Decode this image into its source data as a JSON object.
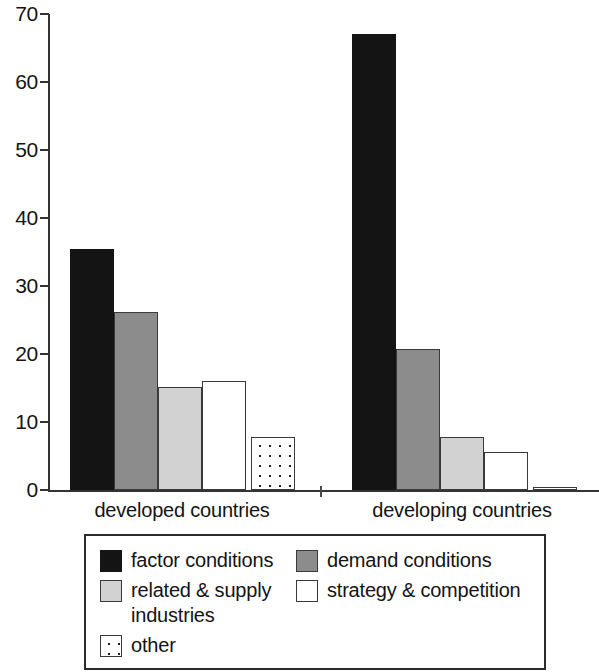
{
  "chart_data": {
    "type": "bar",
    "title": "",
    "subtitle": "",
    "xlabel": "",
    "ylabel": "",
    "categories": [
      "developed countries",
      "developing countries"
    ],
    "series": [
      {
        "name": "factor conditions",
        "key": "factor",
        "fill": "black",
        "values": [
          35.5,
          67.0
        ]
      },
      {
        "name": "demand conditions",
        "key": "demand",
        "fill": "darkgray",
        "values": [
          26.2,
          20.7
        ]
      },
      {
        "name": "related & supply industries",
        "key": "related",
        "fill": "lightgray",
        "values": [
          15.2,
          7.8
        ]
      },
      {
        "name": "strategy & competition",
        "key": "strategy",
        "fill": "white",
        "values": [
          16.0,
          5.6
        ]
      },
      {
        "name": "other",
        "key": "other",
        "fill": "dotted",
        "values": [
          7.8,
          0.4
        ]
      }
    ],
    "ylim": [
      0,
      70
    ],
    "yticks": [
      0,
      10,
      20,
      30,
      40,
      50,
      60,
      70
    ],
    "ytick_labels": [
      "0",
      "10",
      "20",
      "30",
      "40",
      "50",
      "60",
      "70"
    ],
    "grid": false,
    "legend_position": "bottom",
    "legend_entries": [
      {
        "label": "factor conditions",
        "swatch": "black"
      },
      {
        "label": "demand conditions",
        "swatch": "darkgray"
      },
      {
        "label": "related & supply industries",
        "swatch": "lightgray"
      },
      {
        "label": "strategy & competition",
        "swatch": "white"
      },
      {
        "label": "other",
        "swatch": "dotted"
      }
    ],
    "colors": {
      "black": "#141414",
      "darkgray": "#8c8c8c",
      "lightgray": "#d2d2d2",
      "white": "#ffffff",
      "dotted": "#ffffff",
      "axis": "#333333",
      "text": "#141414"
    }
  }
}
